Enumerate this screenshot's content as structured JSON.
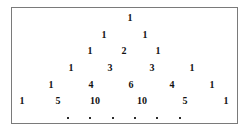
{
  "figure": {
    "border_color": "#7a7a7a",
    "background_color": "#ffffff",
    "text_color": "#111111"
  },
  "chart_data": {
    "type": "table",
    "xlabel": "",
    "ylabel": "",
    "rows": [
      {
        "index": 0,
        "values": [
          1
        ]
      },
      {
        "index": 1,
        "values": [
          1,
          1
        ]
      },
      {
        "index": 2,
        "values": [
          1,
          2,
          1
        ]
      },
      {
        "index": 3,
        "values": [
          1,
          3,
          3,
          1
        ]
      },
      {
        "index": 4,
        "values": [
          1,
          4,
          6,
          4,
          1
        ]
      },
      {
        "index": 5,
        "values": [
          1,
          5,
          10,
          10,
          5,
          1
        ]
      }
    ],
    "continuation_row": {
      "symbol": "·",
      "count": 6
    }
  },
  "cells": [
    {
      "text": "1",
      "x": 130,
      "y": 18
    },
    {
      "text": "1",
      "x": 104,
      "y": 35
    },
    {
      "text": "1",
      "x": 145,
      "y": 35
    },
    {
      "text": "1",
      "x": 90,
      "y": 51
    },
    {
      "text": "2",
      "x": 124,
      "y": 51
    },
    {
      "text": "1",
      "x": 158,
      "y": 51
    },
    {
      "text": "1",
      "x": 71,
      "y": 68
    },
    {
      "text": "3",
      "x": 110,
      "y": 68
    },
    {
      "text": "3",
      "x": 152,
      "y": 68
    },
    {
      "text": "1",
      "x": 192,
      "y": 68
    },
    {
      "text": "1",
      "x": 51,
      "y": 85
    },
    {
      "text": "4",
      "x": 91,
      "y": 85
    },
    {
      "text": "6",
      "x": 131,
      "y": 85
    },
    {
      "text": "4",
      "x": 172,
      "y": 85
    },
    {
      "text": "1",
      "x": 212,
      "y": 85
    },
    {
      "text": "1",
      "x": 22,
      "y": 101
    },
    {
      "text": "5",
      "x": 58,
      "y": 101
    },
    {
      "text": "10",
      "x": 95,
      "y": 101
    },
    {
      "text": "10",
      "x": 142,
      "y": 101
    },
    {
      "text": "5",
      "x": 185,
      "y": 101
    },
    {
      "text": "1",
      "x": 226,
      "y": 101
    }
  ],
  "dots": [
    {
      "x": 68,
      "y": 118
    },
    {
      "x": 90,
      "y": 118
    },
    {
      "x": 113,
      "y": 118
    },
    {
      "x": 135,
      "y": 118
    },
    {
      "x": 157,
      "y": 118
    },
    {
      "x": 180,
      "y": 118
    }
  ]
}
